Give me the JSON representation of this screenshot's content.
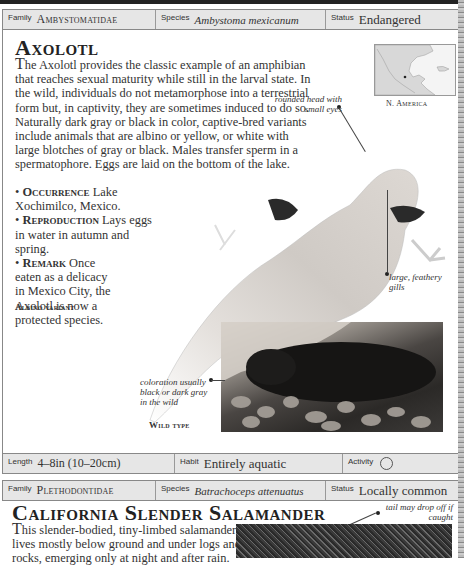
{
  "entries": [
    {
      "info_top": {
        "family_label": "Family",
        "family_value": "Ambystomatidae",
        "species_label": "Species",
        "species_value": "Ambystoma mexicanum",
        "status_label": "Status",
        "status_value": "Endangered"
      },
      "title": "Axolotl",
      "description_lead": "T",
      "description": "he Axolotl provides the classic example of an amphibian that reaches sexual maturity while still in the larval state. In the wild, individuals do not metamorphose into a terrestrial form but, in captivity, they are sometimes induced to do so. Naturally dark gray or black in color, captive-bred variants include animals that are albino or yellow, or white with large blotches of gray or black. Males transfer sperm in a spermatophore. Eggs are laid on the bottom of the lake.",
      "bullets": [
        {
          "key": "Occurrence",
          "text": "Lake Xochimilco, Mexico."
        },
        {
          "key": "Reproduction",
          "text": "Lays eggs in water in autumn and spring."
        },
        {
          "key": "Remark",
          "text": "Once eaten as a delicacy in Mexico City, the Axolotl is now a protected species."
        }
      ],
      "map_caption": "N. America",
      "annotations": {
        "head": "rounded head with small eyes",
        "gills": "large, feathery gills",
        "wild_coloration": "coloration usually black or dark gray in the wild"
      },
      "photo_labels": {
        "albino": "Albino variant",
        "wild": "Wild type"
      },
      "info_bottom": {
        "length_label": "Length",
        "length_value": "4–8in (10–20cm)",
        "habit_label": "Habit",
        "habit_value": "Entirely aquatic",
        "activity_label": "Activity",
        "activity_icon": "nocturnal-circle-icon"
      }
    },
    {
      "info_top": {
        "family_label": "Family",
        "family_value": "Plethodontidae",
        "species_label": "Species",
        "species_value": "Batrachoceps attenuatus",
        "status_label": "Status",
        "status_value": "Locally common"
      },
      "title": "California Slender Salamander",
      "description_lead": "T",
      "description_line1": "his slender-bodied, tiny-limbed salamander",
      "description_line2": "lives mostly below ground and under logs and",
      "description_line3": "rocks, emerging only at night and after rain.",
      "annotations": {
        "tail": "tail may drop off if caught"
      }
    }
  ],
  "colors": {
    "infobar_bg": "#e6e6e6",
    "text": "#222222",
    "border": "#888888"
  }
}
